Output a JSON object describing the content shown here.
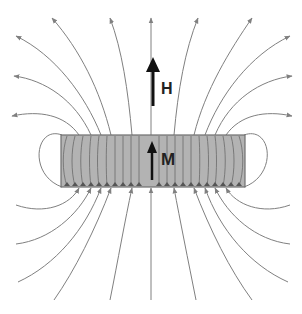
{
  "diagram": {
    "labels": {
      "field": "H",
      "magnetization": "M"
    },
    "colors": {
      "field_line": "#808080",
      "bar_fill": "#b3b3b3",
      "bar_stroke": "#6e6e6e",
      "arrow": "#111111"
    }
  }
}
